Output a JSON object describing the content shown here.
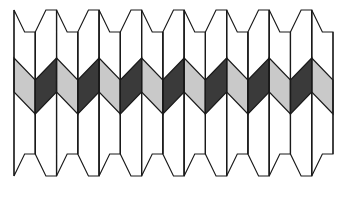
{
  "figure": {
    "kind": "geometric-pattern",
    "canvas": {
      "width": 347,
      "height": 198,
      "background": "#ffffff"
    }
  },
  "geometry": {
    "left": 14,
    "right": 333,
    "top": 10,
    "bottom": 176,
    "columns": 15,
    "divider_lines": 16,
    "column_width": 21.27,
    "point_depth": 22,
    "band_top_y": 58,
    "band_bottom_y": 114,
    "band_amplitude": 22,
    "peak_period_columns": 2,
    "stroke_color": "#1a1a1a",
    "stroke_width": 1.15
  },
  "palette": {
    "paper": "#ffffff",
    "cell_fill": "#ffffff",
    "light_chevron": "#c9c9c9",
    "dark_chevron": "#3a3a3a",
    "outline": "#1a1a1a"
  },
  "band_sequence": [
    "light",
    "dark",
    "light",
    "dark",
    "light",
    "dark",
    "light",
    "dark",
    "light",
    "dark",
    "light",
    "dark",
    "light",
    "dark",
    "light"
  ],
  "labels": {
    "figure_caption": "",
    "axis_labels": [],
    "legend": []
  }
}
